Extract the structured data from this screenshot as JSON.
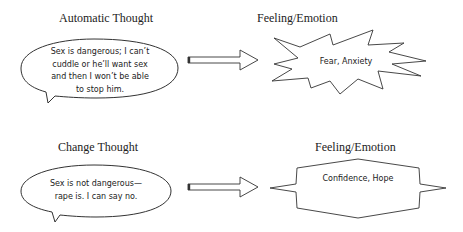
{
  "diagram": {
    "rows": [
      {
        "thought_heading": "Automatic Thought",
        "thought_text": "Sex is dangerous; I can't cuddle or he'll want sex and then I won't be able to stop him.",
        "thought_lines": [
          "Sex is dangerous; I can’t",
          "cuddle or he’ll want sex",
          "and then I won’t be able",
          "to stop him."
        ],
        "emotion_heading": "Feeling/Emotion",
        "emotion_text": "Fear, Anxiety",
        "emotion_shape": "explosion-star"
      },
      {
        "thought_heading": "Change Thought",
        "thought_text": "Sex is not dangerous—rape is. I can say no.",
        "thought_lines": [
          "Sex is not dangerous—",
          "rape is. I can say no."
        ],
        "emotion_heading": "Feeling/Emotion",
        "emotion_text": "Confidence, Hope",
        "emotion_shape": "eight-point-star"
      }
    ],
    "connector": "block-right-arrow",
    "colors": {
      "stroke": "#333333",
      "fill": "#ffffff",
      "text": "#222222"
    }
  }
}
